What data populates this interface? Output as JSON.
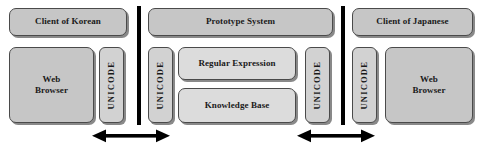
{
  "diagram": {
    "colors": {
      "box_fill_outer": "#c6c6c6",
      "box_fill_inner": "#dcdcdc",
      "box_border": "#4a4a4a",
      "divider": "#000000",
      "arrow": "#000000",
      "background": "#ffffff",
      "text": "#1a1a1a"
    },
    "left_group": {
      "client_header": "Client of Korean",
      "browser": "Web\nBrowser",
      "unicode": "UNICODE"
    },
    "center_group": {
      "system_header": "Prototype System",
      "unicode_left": "UNICODE",
      "unicode_right": "UNICODE",
      "modules": [
        {
          "label": "Regular Expression"
        },
        {
          "label": "Knowledge Base"
        }
      ]
    },
    "right_group": {
      "client_header": "Client of Japanese",
      "browser": "Web\nBrowser",
      "unicode": "UNICODE"
    },
    "connectors": [
      {
        "name": "left-bidirectional-arrow",
        "kind": "double-headed-arrow"
      },
      {
        "name": "right-bidirectional-arrow",
        "kind": "double-headed-arrow"
      }
    ],
    "dividers": [
      {
        "name": "left-boundary-divider"
      },
      {
        "name": "right-boundary-divider"
      }
    ]
  }
}
